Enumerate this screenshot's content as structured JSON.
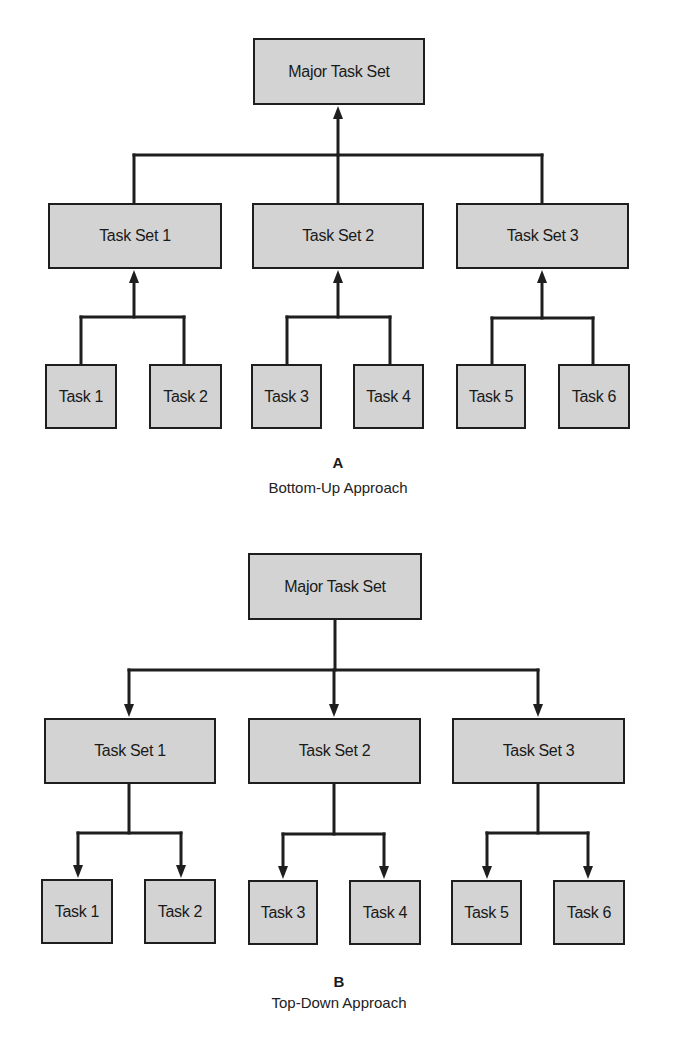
{
  "style": {
    "box_fill": "#d3d3d3",
    "line_color": "#1e1e1e",
    "text_color": "#1a1a1a"
  },
  "diagrams": [
    {
      "id": "A",
      "letter": "A",
      "caption": "Bottom-Up Approach",
      "direction": "up",
      "letter_pos": {
        "x": 338,
        "y": 454
      },
      "caption_pos": {
        "x": 338,
        "y": 479
      },
      "nodes": [
        {
          "id": "major",
          "label": "Major Task Set",
          "x": 253,
          "y": 38,
          "w": 172,
          "h": 67
        },
        {
          "id": "ts1",
          "label": "Task Set 1",
          "x": 48,
          "y": 203,
          "w": 174,
          "h": 66
        },
        {
          "id": "ts2",
          "label": "Task Set 2",
          "x": 252,
          "y": 203,
          "w": 172,
          "h": 66
        },
        {
          "id": "ts3",
          "label": "Task Set 3",
          "x": 456,
          "y": 203,
          "w": 173,
          "h": 66
        },
        {
          "id": "t1",
          "label": "Task 1",
          "x": 45,
          "y": 364,
          "w": 72,
          "h": 65
        },
        {
          "id": "t2",
          "label": "Task 2",
          "x": 149,
          "y": 364,
          "w": 73,
          "h": 65
        },
        {
          "id": "t3",
          "label": "Task 3",
          "x": 251,
          "y": 364,
          "w": 71,
          "h": 65
        },
        {
          "id": "t4",
          "label": "Task 4",
          "x": 353,
          "y": 364,
          "w": 71,
          "h": 65
        },
        {
          "id": "t5",
          "label": "Task 5",
          "x": 456,
          "y": 364,
          "w": 70,
          "h": 65
        },
        {
          "id": "t6",
          "label": "Task 6",
          "x": 558,
          "y": 364,
          "w": 72,
          "h": 65
        }
      ],
      "connectors": [
        {
          "parent_x": 338,
          "parent_y": 105,
          "bus_y": 155,
          "children": [
            {
              "x": 134,
              "y": 203
            },
            {
              "x": 338,
              "y": 203
            },
            {
              "x": 542,
              "y": 203
            }
          ]
        },
        {
          "parent_x": 134,
          "parent_y": 269,
          "bus_y": 317,
          "children": [
            {
              "x": 81,
              "y": 364
            },
            {
              "x": 184,
              "y": 364
            }
          ]
        },
        {
          "parent_x": 338,
          "parent_y": 269,
          "bus_y": 317,
          "children": [
            {
              "x": 287,
              "y": 364
            },
            {
              "x": 390,
              "y": 364
            }
          ]
        },
        {
          "parent_x": 542,
          "parent_y": 269,
          "bus_y": 318,
          "children": [
            {
              "x": 492,
              "y": 364
            },
            {
              "x": 593,
              "y": 364
            }
          ]
        }
      ]
    },
    {
      "id": "B",
      "letter": "B",
      "caption": "Top-Down Approach",
      "direction": "down",
      "letter_pos": {
        "x": 339,
        "y": 973
      },
      "caption_pos": {
        "x": 339,
        "y": 994
      },
      "nodes": [
        {
          "id": "major",
          "label": "Major Task Set",
          "x": 248,
          "y": 553,
          "w": 174,
          "h": 67
        },
        {
          "id": "ts1",
          "label": "Task Set 1",
          "x": 44,
          "y": 718,
          "w": 172,
          "h": 66
        },
        {
          "id": "ts2",
          "label": "Task Set 2",
          "x": 248,
          "y": 718,
          "w": 173,
          "h": 66
        },
        {
          "id": "ts3",
          "label": "Task Set 3",
          "x": 452,
          "y": 718,
          "w": 173,
          "h": 66
        },
        {
          "id": "t1",
          "label": "Task 1",
          "x": 41,
          "y": 879,
          "w": 72,
          "h": 65
        },
        {
          "id": "t2",
          "label": "Task 2",
          "x": 144,
          "y": 879,
          "w": 72,
          "h": 65
        },
        {
          "id": "t3",
          "label": "Task 3",
          "x": 248,
          "y": 880,
          "w": 70,
          "h": 65
        },
        {
          "id": "t4",
          "label": "Task 4",
          "x": 349,
          "y": 880,
          "w": 72,
          "h": 65
        },
        {
          "id": "t5",
          "label": "Task 5",
          "x": 451,
          "y": 880,
          "w": 71,
          "h": 65
        },
        {
          "id": "t6",
          "label": "Task 6",
          "x": 553,
          "y": 880,
          "w": 72,
          "h": 65
        }
      ],
      "connectors": [
        {
          "parent_x": 335,
          "parent_y": 620,
          "bus_y": 670,
          "children": [
            {
              "x": 129,
              "y": 718
            },
            {
              "x": 334,
              "y": 718
            },
            {
              "x": 538,
              "y": 718
            }
          ]
        },
        {
          "parent_x": 129,
          "parent_y": 784,
          "bus_y": 833,
          "children": [
            {
              "x": 78,
              "y": 879
            },
            {
              "x": 181,
              "y": 879
            }
          ]
        },
        {
          "parent_x": 334,
          "parent_y": 784,
          "bus_y": 834,
          "children": [
            {
              "x": 283,
              "y": 880
            },
            {
              "x": 384,
              "y": 880
            }
          ]
        },
        {
          "parent_x": 538,
          "parent_y": 784,
          "bus_y": 833,
          "children": [
            {
              "x": 487,
              "y": 880
            },
            {
              "x": 588,
              "y": 880
            }
          ]
        }
      ]
    }
  ]
}
